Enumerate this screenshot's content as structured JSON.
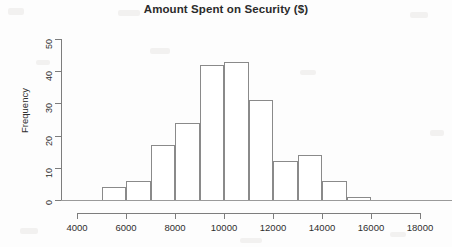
{
  "chart_data": {
    "type": "bar",
    "title": "Amount Spent on Security ($)",
    "xlabel": "",
    "ylabel": "Frequency",
    "xlim": [
      4000,
      18000
    ],
    "ylim": [
      0,
      50
    ],
    "grid": false,
    "legend": false,
    "bin_width": 1000,
    "bins": [
      {
        "start": 5000,
        "end": 6000,
        "value": 4
      },
      {
        "start": 6000,
        "end": 7000,
        "value": 6
      },
      {
        "start": 7000,
        "end": 8000,
        "value": 17
      },
      {
        "start": 8000,
        "end": 9000,
        "value": 24
      },
      {
        "start": 9000,
        "end": 10000,
        "value": 42
      },
      {
        "start": 10000,
        "end": 11000,
        "value": 43
      },
      {
        "start": 11000,
        "end": 12000,
        "value": 31
      },
      {
        "start": 12000,
        "end": 13000,
        "value": 12
      },
      {
        "start": 13000,
        "end": 14000,
        "value": 14
      },
      {
        "start": 14000,
        "end": 15000,
        "value": 6
      },
      {
        "start": 15000,
        "end": 16000,
        "value": 1
      }
    ],
    "categories": [
      "5000-6000",
      "6000-7000",
      "7000-8000",
      "8000-9000",
      "9000-10000",
      "10000-11000",
      "11000-12000",
      "12000-13000",
      "13000-14000",
      "14000-15000",
      "15000-16000"
    ],
    "values": [
      4,
      6,
      17,
      24,
      42,
      43,
      31,
      12,
      14,
      6,
      1
    ],
    "x_ticks": [
      4000,
      6000,
      8000,
      10000,
      12000,
      14000,
      16000,
      18000
    ],
    "x_tick_labels": [
      "4000",
      "6000",
      "8000",
      "10000",
      "12000",
      "14000",
      "16000",
      "18000"
    ],
    "y_ticks": [
      0,
      10,
      20,
      30,
      40,
      50
    ],
    "y_tick_labels": [
      "0",
      "10",
      "20",
      "30",
      "40",
      "50"
    ],
    "colors": {
      "bar_outline": "#8a8a8a",
      "bar_fill": "#ffffff",
      "axis": "#7d7d7d",
      "text": "#2f2f2f",
      "title": "#2b2b2b",
      "background": "#fdfdfd"
    }
  }
}
